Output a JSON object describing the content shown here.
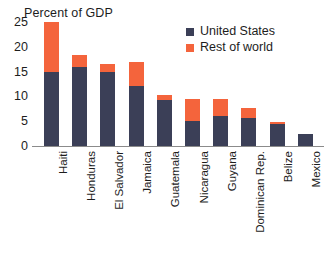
{
  "chart_data": {
    "type": "bar",
    "title": "Percent of GDP",
    "xlabel": "",
    "ylabel": "",
    "ylim": [
      0,
      25
    ],
    "yticks": [
      0,
      5,
      10,
      15,
      20,
      25
    ],
    "grid": false,
    "stacked": true,
    "legend_position": "top-right",
    "categories": [
      "Haiti",
      "Honduras",
      "El Salvador",
      "Jamaica",
      "Guatemala",
      "Nicaragua",
      "Guyana",
      "Dominican Rep.",
      "Belize",
      "Mexico"
    ],
    "series": [
      {
        "name": "United States",
        "color": "#3b3f57",
        "values": [
          15.0,
          16.0,
          15.0,
          12.0,
          9.2,
          5.0,
          6.0,
          5.6,
          4.4,
          2.5
        ]
      },
      {
        "name": "Rest of world",
        "color": "#f4643c",
        "values": [
          10.0,
          2.4,
          1.6,
          5.0,
          1.0,
          4.5,
          3.5,
          2.0,
          0.5,
          0.0
        ]
      }
    ],
    "totals": [
      25.0,
      18.4,
      16.6,
      17.0,
      10.2,
      9.5,
      9.5,
      7.6,
      4.9,
      2.5
    ]
  },
  "legend": {
    "entries": [
      {
        "label": "United States",
        "color": "#3b3f57"
      },
      {
        "label": "Rest of world",
        "color": "#f4643c"
      }
    ]
  },
  "axis": {
    "tick_labels": [
      "25",
      "20",
      "15",
      "10",
      "5",
      "0"
    ]
  }
}
